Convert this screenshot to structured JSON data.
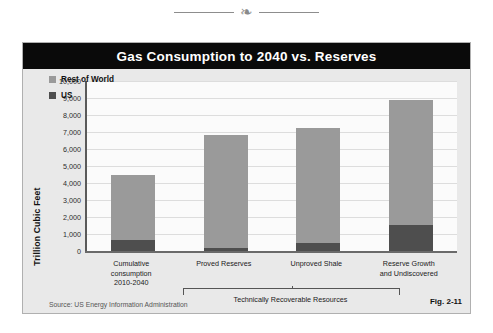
{
  "ornament": {
    "glyph": "❧"
  },
  "figure": {
    "title": "Gas Consumption to 2040 vs. Reserves",
    "source_text": "Source:  US Energy Information Administration",
    "fig_label": "Fig. 2-11",
    "bracket_label": "Technically Recoverable Resources"
  },
  "colors": {
    "title_bar": "#0a0a0a",
    "title_text": "#ffffff",
    "panel": "#e9e9e9",
    "plot": "#fbfbfb",
    "rest_of_world": "#9a9a9a",
    "us": "#4e4e4e",
    "gridline": "#dddddd",
    "axis": "#6a6a6a"
  },
  "chart_data": {
    "type": "bar",
    "subtype": "stacked",
    "title": "Gas Consumption to 2040 vs. Reserves",
    "xlabel": "",
    "ylabel": "Trillion Cubic Feet",
    "ylim": [
      0,
      10000
    ],
    "ytick_step": 1000,
    "grid": true,
    "legend_position": "top-left",
    "ytick_labels": [
      "10,000",
      "9,000",
      "8,000",
      "7,000",
      "6,000",
      "5,000",
      "4,000",
      "3,000",
      "2,000",
      "1,000",
      "0"
    ],
    "ytick_values": [
      10000,
      9000,
      8000,
      7000,
      6000,
      5000,
      4000,
      3000,
      2000,
      1000,
      0
    ],
    "categories": [
      "Cumulative\nconsumption\n2010-2040",
      "Proved Reserves",
      "Unproved Shale",
      "Reserve Growth\nand Undiscovered"
    ],
    "category_lines": [
      [
        "Cumulative",
        "consumption",
        "2010-2040"
      ],
      [
        "Proved Reserves"
      ],
      [
        "Unproved Shale"
      ],
      [
        "Reserve Growth",
        "and Undiscovered"
      ]
    ],
    "series": [
      {
        "name": "US",
        "color": "#4e4e4e",
        "values": [
          650,
          200,
          450,
          1550
        ]
      },
      {
        "name": "Rest of World",
        "color": "#9a9a9a",
        "values": [
          3800,
          6650,
          6800,
          7350
        ]
      }
    ],
    "totals": [
      4450,
      6850,
      7250,
      8900
    ],
    "annotations": [
      {
        "text": "Technically Recoverable Resources",
        "spans_categories": [
          "Proved Reserves",
          "Unproved Shale",
          "Reserve Growth and Undiscovered"
        ]
      }
    ],
    "source": "Source:  US Energy Information Administration"
  },
  "legend": {
    "items": [
      {
        "label": "Rest of World",
        "color": "#9a9a9a"
      },
      {
        "label": "US",
        "color": "#4e4e4e"
      }
    ]
  }
}
